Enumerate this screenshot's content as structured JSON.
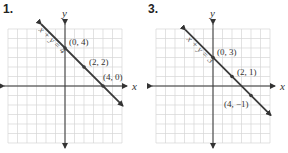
{
  "graphs": [
    {
      "number": "1.",
      "x_axis_label": "x",
      "y_axis_label": "y",
      "equation": "x + y = 4",
      "origin_px": [
        65,
        86
      ],
      "unit_px": 9.5,
      "grid_range": {
        "xmin": -6,
        "xmax": 6,
        "ymin": -6,
        "ymax": 6
      },
      "line": {
        "slope": -1,
        "intercept": 4,
        "x_start": -2.5,
        "x_end": 6.1
      },
      "points": [
        {
          "x": 0,
          "y": 4,
          "label": "(0, 4)",
          "dx": 4,
          "dy": -3
        },
        {
          "x": 2,
          "y": 2,
          "label": "(2, 2)",
          "dx": 5,
          "dy": -2
        },
        {
          "x": 4,
          "y": 0,
          "label": "(4, 0)",
          "dx": 0,
          "dy": -6
        }
      ]
    },
    {
      "number": "3.",
      "x_axis_label": "x",
      "y_axis_label": "y",
      "equation": "x + y = 3",
      "origin_px": [
        69,
        86
      ],
      "unit_px": 9.5,
      "grid_range": {
        "xmin": -6,
        "xmax": 6,
        "ymin": -6,
        "ymax": 6
      },
      "line": {
        "slope": -1,
        "intercept": 3,
        "x_start": -2.9,
        "x_end": 6.1
      },
      "points": [
        {
          "x": 0,
          "y": 3,
          "label": "(0, 3)",
          "dx": 4,
          "dy": -3
        },
        {
          "x": 2,
          "y": 1,
          "label": "(2, 1)",
          "dx": 5,
          "dy": -2
        },
        {
          "x": 4,
          "y": -1,
          "label": "(4, −1)",
          "dx": -27,
          "dy": 11
        }
      ]
    }
  ],
  "colors": {
    "grid": "#d6d6d6",
    "axis": "#333333",
    "line": "#3a3a3a",
    "text": "#333333"
  }
}
